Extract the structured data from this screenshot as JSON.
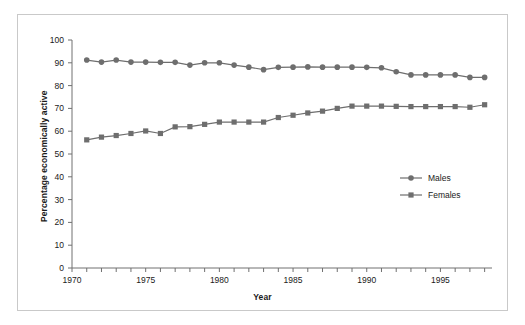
{
  "chart_data": {
    "type": "line",
    "title": "",
    "xlabel": "Year",
    "ylabel": "Percentage economically active",
    "xlim": [
      1970,
      1998.5
    ],
    "ylim": [
      0,
      100
    ],
    "grid": false,
    "legend_position": "center-right",
    "x": [
      1971,
      1972,
      1973,
      1974,
      1975,
      1976,
      1977,
      1978,
      1979,
      1980,
      1981,
      1982,
      1983,
      1984,
      1985,
      1986,
      1987,
      1988,
      1989,
      1990,
      1991,
      1992,
      1993,
      1994,
      1995,
      1996,
      1997,
      1998
    ],
    "xticks": [
      1970,
      1971,
      1972,
      1973,
      1974,
      1975,
      1976,
      1977,
      1978,
      1979,
      1980,
      1981,
      1982,
      1983,
      1984,
      1985,
      1986,
      1987,
      1988,
      1989,
      1990,
      1991,
      1992,
      1993,
      1994,
      1995,
      1996,
      1997,
      1998
    ],
    "xtick_labels": [
      "1970",
      "1975",
      "1980",
      "1985",
      "1990",
      "1995"
    ],
    "xtick_label_values": [
      1970,
      1975,
      1980,
      1985,
      1990,
      1995
    ],
    "yticks": [
      0,
      10,
      20,
      30,
      40,
      50,
      60,
      70,
      80,
      90,
      100
    ],
    "ytick_labels": [
      "0",
      "10",
      "20",
      "30",
      "40",
      "50",
      "60",
      "70",
      "80",
      "90",
      "100"
    ],
    "series": [
      {
        "name": "Males",
        "marker": "circle",
        "color": "#6e6e6e",
        "values": [
          91.2,
          90.3,
          91.2,
          90.3,
          90.3,
          90.2,
          90.2,
          89.0,
          90.0,
          90.0,
          89.0,
          88.1,
          87.0,
          88.0,
          88.1,
          88.2,
          88.1,
          88.1,
          88.1,
          88.0,
          87.8,
          86.1,
          84.7,
          84.7,
          84.7,
          84.7,
          83.6,
          83.6
        ]
      },
      {
        "name": "Females",
        "marker": "square",
        "color": "#6e6e6e",
        "values": [
          56.2,
          57.4,
          58.1,
          59.0,
          60.1,
          59.0,
          61.9,
          62.0,
          63.0,
          64.0,
          64.0,
          64.0,
          64.0,
          66.0,
          67.0,
          68.0,
          68.8,
          70.0,
          71.0,
          71.0,
          71.0,
          70.9,
          70.8,
          70.8,
          70.8,
          70.8,
          70.5,
          71.6
        ]
      }
    ]
  },
  "legend": {
    "entries": [
      {
        "label": "Males"
      },
      {
        "label": "Females"
      }
    ]
  }
}
